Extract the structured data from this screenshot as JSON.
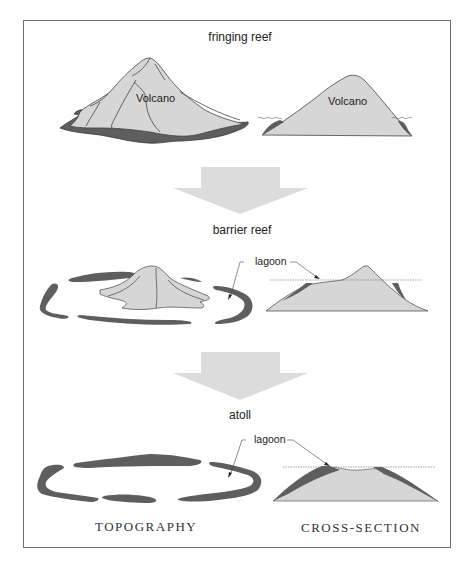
{
  "stages": [
    {
      "label": "fringing reef",
      "volcano_label_topo": "Volcano",
      "volcano_label_section": "Volcano"
    },
    {
      "label": "barrier reef",
      "lagoon_label": "lagoon"
    },
    {
      "label": "atoll",
      "lagoon_label": "lagoon"
    }
  ],
  "columns": {
    "left": "TOPOGRAPHY",
    "right": "CROSS-SECTION"
  },
  "colors": {
    "volcano_fill": "#d6d6d6",
    "reef_fill": "#5e5e5e",
    "arrow_fill": "#dcdcdc",
    "outline": "#444444",
    "frame": "#6e6e6e"
  }
}
